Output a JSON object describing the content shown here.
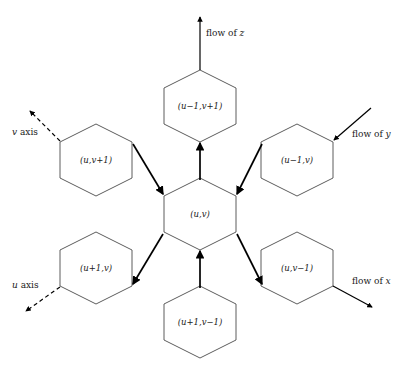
{
  "figure": {
    "type": "hexagonal-lattice-flow-diagram",
    "background": "#ffffff",
    "line_color": "#1a1a1a",
    "hex_stroke": "#4a4a4a",
    "arrow_color": "#000000"
  },
  "hexagons": [
    {
      "id": "center",
      "label": "(u,v)",
      "cx": 200,
      "cy": 214
    },
    {
      "id": "up",
      "label": "(u−1,v+1)",
      "cx": 200,
      "cy": 106
    },
    {
      "id": "upper-left",
      "label": "(u,v+1)",
      "cx": 96,
      "cy": 160
    },
    {
      "id": "upper-right",
      "label": "(u−1,v)",
      "cx": 297,
      "cy": 160
    },
    {
      "id": "lower-left",
      "label": "(u+1,v)",
      "cx": 96,
      "cy": 268
    },
    {
      "id": "lower-right",
      "label": "(u,v−1)",
      "cx": 297,
      "cy": 268
    },
    {
      "id": "down",
      "label": "(u+1,v−1)",
      "cx": 200,
      "cy": 322
    }
  ],
  "flows": [
    {
      "id": "flow-z",
      "label_prefix": "flow of ",
      "var": "z",
      "label": "flow of z",
      "direction": "up",
      "label_x": 206,
      "label_y": 33
    },
    {
      "id": "flow-y",
      "label_prefix": "flow of ",
      "var": "y",
      "label": "flow of y",
      "direction": "down-left",
      "label_x": 352,
      "label_y": 136
    },
    {
      "id": "flow-x",
      "label_prefix": "flow of ",
      "var": "x",
      "label": "flow of x",
      "direction": "down-right",
      "label_x": 352,
      "label_y": 284
    }
  ],
  "axes": [
    {
      "id": "v-axis",
      "label_prefix": "",
      "var": "v",
      "suffix": " axis",
      "label": "v axis",
      "direction": "up-left",
      "label_x": 12,
      "label_y": 133
    },
    {
      "id": "u-axis",
      "label_prefix": "",
      "var": "u",
      "suffix": " axis",
      "label": "u axis",
      "direction": "down-left",
      "label_x": 12,
      "label_y": 286
    }
  ]
}
